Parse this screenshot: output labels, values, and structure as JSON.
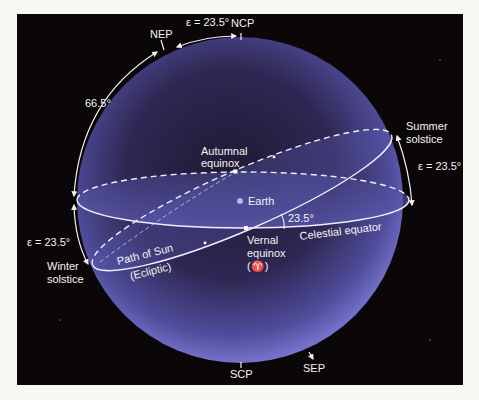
{
  "diagram": {
    "colors": {
      "background": "#0b0709",
      "sphere_center": "#241d3c",
      "sphere_rim": "#6e6dc4",
      "line": "#eeeeff",
      "text": "#f2f2f2"
    },
    "labels": {
      "ncp": "NCP",
      "nep": "NEP",
      "scp": "SCP",
      "sep": "SEP",
      "obliquity_top": "ε = 23.5°",
      "colatitude": "66.5°",
      "summer_solstice_line1": "Summer",
      "summer_solstice_line2": "solstice",
      "obliquity_right": "ε = 23.5°",
      "winter_solstice_line1": "Winter",
      "winter_solstice_line2": "solstice",
      "obliquity_left": "ε = 23.5°",
      "autumnal_equinox_line1": "Autumnal",
      "autumnal_equinox_line2": "equinox",
      "vernal_equinox_line1": "Vernal",
      "vernal_equinox_line2": "equinox",
      "vernal_equinox_symbol": "(♈)",
      "earth": "Earth",
      "tilt_angle": "23.5°",
      "celestial_equator": "Celestial equator",
      "path_of_sun": "Path of Sun",
      "ecliptic": "(Ecliptic)"
    }
  }
}
